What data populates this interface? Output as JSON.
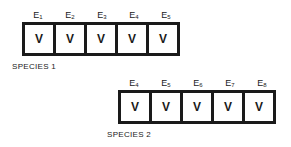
{
  "species": [
    {
      "name": "SPECIES 1",
      "cells": [
        {
          "label": "E",
          "sub": "1",
          "value": "V"
        },
        {
          "label": "E",
          "sub": "2",
          "value": "V"
        },
        {
          "label": "E",
          "sub": "3",
          "value": "V"
        },
        {
          "label": "E",
          "sub": "4",
          "value": "V"
        },
        {
          "label": "E",
          "sub": "5",
          "value": "V"
        }
      ]
    },
    {
      "name": "SPECIES 2",
      "cells": [
        {
          "label": "E",
          "sub": "4",
          "value": "V"
        },
        {
          "label": "E",
          "sub": "5",
          "value": "V"
        },
        {
          "label": "E",
          "sub": "6",
          "value": "V"
        },
        {
          "label": "E",
          "sub": "7",
          "value": "V"
        },
        {
          "label": "E",
          "sub": "8",
          "value": "V"
        }
      ]
    }
  ]
}
